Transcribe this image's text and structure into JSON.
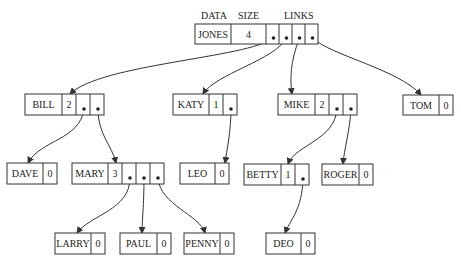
{
  "headers": [
    {
      "id": "data",
      "text": "DATA",
      "x": 201,
      "y": 19
    },
    {
      "id": "size",
      "text": "SIZE",
      "x": 238,
      "y": 19
    },
    {
      "id": "links",
      "text": "LINKS",
      "x": 284,
      "y": 19
    }
  ],
  "nodes": [
    {
      "id": "jones",
      "data": "JONES",
      "size": "4",
      "x": 195,
      "y": 24,
      "dataW": 36,
      "sizeW": 35,
      "linkW": 13,
      "links": 4,
      "h": 20
    },
    {
      "id": "bill",
      "data": "BILL",
      "size": "2",
      "x": 25,
      "y": 94,
      "dataW": 37,
      "sizeW": 14,
      "linkW": 14,
      "links": 2,
      "h": 21
    },
    {
      "id": "katy",
      "data": "KATY",
      "size": "1",
      "x": 173,
      "y": 94,
      "dataW": 36,
      "sizeW": 14,
      "linkW": 14,
      "links": 1,
      "h": 21
    },
    {
      "id": "mike",
      "data": "MIKE",
      "size": "2",
      "x": 278,
      "y": 94,
      "dataW": 37,
      "sizeW": 14,
      "linkW": 14,
      "links": 2,
      "h": 21
    },
    {
      "id": "tom",
      "data": "TOM",
      "size": "0",
      "x": 403,
      "y": 95,
      "dataW": 36,
      "sizeW": 14,
      "linkW": 0,
      "links": 0,
      "h": 20
    },
    {
      "id": "dave",
      "data": "DAVE",
      "size": "0",
      "x": 7,
      "y": 163,
      "dataW": 36,
      "sizeW": 14,
      "linkW": 0,
      "links": 0,
      "h": 21
    },
    {
      "id": "mary",
      "data": "MARY",
      "size": "3",
      "x": 72,
      "y": 163,
      "dataW": 36,
      "sizeW": 14,
      "linkW": 14,
      "links": 3,
      "h": 21
    },
    {
      "id": "leo",
      "data": "LEO",
      "size": "0",
      "x": 180,
      "y": 163,
      "dataW": 35,
      "sizeW": 14,
      "linkW": 0,
      "links": 0,
      "h": 21
    },
    {
      "id": "betty",
      "data": "BETTY",
      "size": "1",
      "x": 244,
      "y": 164,
      "dataW": 37,
      "sizeW": 14,
      "linkW": 14,
      "links": 1,
      "h": 21
    },
    {
      "id": "roger",
      "data": "ROGER",
      "size": "0",
      "x": 322,
      "y": 164,
      "dataW": 37,
      "sizeW": 14,
      "linkW": 0,
      "links": 0,
      "h": 21
    },
    {
      "id": "larry",
      "data": "LARRY",
      "size": "0",
      "x": 55,
      "y": 233,
      "dataW": 36,
      "sizeW": 14,
      "linkW": 0,
      "links": 0,
      "h": 21
    },
    {
      "id": "paul",
      "data": "PAUL",
      "size": "0",
      "x": 120,
      "y": 233,
      "dataW": 37,
      "sizeW": 14,
      "linkW": 0,
      "links": 0,
      "h": 21
    },
    {
      "id": "penny",
      "data": "PENNY",
      "size": "0",
      "x": 184,
      "y": 233,
      "dataW": 36,
      "sizeW": 14,
      "linkW": 0,
      "links": 0,
      "h": 21
    },
    {
      "id": "deo",
      "data": "DEO",
      "size": "0",
      "x": 266,
      "y": 233,
      "dataW": 35,
      "sizeW": 14,
      "linkW": 0,
      "links": 0,
      "h": 21
    }
  ],
  "edges": [
    {
      "from": "jones",
      "slot": 0,
      "to": "bill",
      "tx": 70,
      "ty": 94,
      "c1": [
        248,
        58
      ],
      "c2": [
        100,
        64
      ]
    },
    {
      "from": "jones",
      "slot": 1,
      "to": "katy",
      "tx": 203,
      "ty": 94,
      "c1": [
        275,
        60
      ],
      "c2": [
        215,
        74
      ]
    },
    {
      "from": "jones",
      "slot": 2,
      "to": "mike",
      "tx": 292,
      "ty": 94,
      "c1": [
        290,
        62
      ],
      "c2": [
        290,
        80
      ]
    },
    {
      "from": "jones",
      "slot": 3,
      "to": "tom",
      "tx": 421,
      "ty": 95,
      "c1": [
        330,
        55
      ],
      "c2": [
        400,
        70
      ]
    },
    {
      "from": "bill",
      "slot": 0,
      "to": "dave",
      "tx": 28,
      "ty": 163,
      "c1": [
        80,
        140
      ],
      "c2": [
        40,
        140
      ]
    },
    {
      "from": "bill",
      "slot": 1,
      "to": "mary",
      "tx": 116,
      "ty": 163,
      "c1": [
        98,
        135
      ],
      "c2": [
        112,
        145
      ]
    },
    {
      "from": "katy",
      "slot": 0,
      "to": "leo",
      "tx": 225,
      "ty": 163,
      "c1": [
        231,
        130
      ],
      "c2": [
        227,
        150
      ]
    },
    {
      "from": "mike",
      "slot": 0,
      "to": "betty",
      "tx": 288,
      "ty": 164,
      "c1": [
        335,
        140
      ],
      "c2": [
        295,
        145
      ]
    },
    {
      "from": "mike",
      "slot": 1,
      "to": "roger",
      "tx": 343,
      "ty": 164,
      "c1": [
        350,
        130
      ],
      "c2": [
        344,
        150
      ]
    },
    {
      "from": "mary",
      "slot": 0,
      "to": "larry",
      "tx": 77,
      "ty": 233,
      "c1": [
        130,
        210
      ],
      "c2": [
        90,
        215
      ]
    },
    {
      "from": "mary",
      "slot": 1,
      "to": "paul",
      "tx": 142,
      "ty": 233,
      "c1": [
        144,
        205
      ],
      "c2": [
        142,
        220
      ]
    },
    {
      "from": "mary",
      "slot": 2,
      "to": "penny",
      "tx": 205,
      "ty": 233,
      "c1": [
        160,
        205
      ],
      "c2": [
        200,
        215
      ]
    },
    {
      "from": "betty",
      "slot": 0,
      "to": "deo",
      "tx": 285,
      "ty": 233,
      "c1": [
        302,
        210
      ],
      "c2": [
        290,
        220
      ]
    }
  ]
}
